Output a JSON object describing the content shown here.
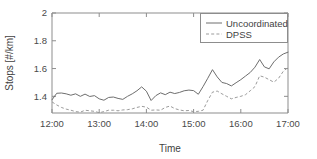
{
  "chart_data": {
    "type": "line",
    "title": "",
    "xlabel": "Time",
    "ylabel": "Stops [#/km]",
    "xlim": [
      12.0,
      17.0
    ],
    "ylim": [
      1.28,
      2.0
    ],
    "grid": false,
    "legend_position": "top-right",
    "xticks": [
      12.0,
      13.0,
      14.0,
      15.0,
      16.0,
      17.0
    ],
    "xticklabels": [
      "12:00",
      "13:00",
      "14:00",
      "15:00",
      "16:00",
      "17:00"
    ],
    "yticks": [
      1.4,
      1.6,
      1.8,
      2.0
    ],
    "yticklabels": [
      "1.4",
      "1.6",
      "1.8",
      "2"
    ],
    "x": [
      12.0,
      12.1,
      12.2,
      12.3,
      12.4,
      12.5,
      12.6,
      12.7,
      12.8,
      12.9,
      13.0,
      13.1,
      13.2,
      13.3,
      13.4,
      13.5,
      13.6,
      13.7,
      13.8,
      13.9,
      14.0,
      14.1,
      14.2,
      14.3,
      14.4,
      14.5,
      14.6,
      14.7,
      14.8,
      14.9,
      15.0,
      15.1,
      15.2,
      15.3,
      15.4,
      15.5,
      15.6,
      15.7,
      15.8,
      15.9,
      16.0,
      16.1,
      16.2,
      16.3,
      16.4,
      16.5,
      16.6,
      16.7,
      16.8,
      16.9,
      17.0
    ],
    "series": [
      {
        "name": "Uncoordinated",
        "style": "solid",
        "color": "#6e6e6e",
        "values": [
          1.375,
          1.422,
          1.424,
          1.418,
          1.408,
          1.418,
          1.4,
          1.416,
          1.399,
          1.405,
          1.382,
          1.372,
          1.392,
          1.395,
          1.385,
          1.378,
          1.4,
          1.418,
          1.44,
          1.468,
          1.437,
          1.37,
          1.405,
          1.425,
          1.412,
          1.43,
          1.42,
          1.428,
          1.44,
          1.445,
          1.441,
          1.415,
          1.47,
          1.53,
          1.592,
          1.54,
          1.5,
          1.492,
          1.475,
          1.498,
          1.52,
          1.546,
          1.572,
          1.61,
          1.665,
          1.612,
          1.598,
          1.648,
          1.682,
          1.705,
          1.718
        ]
      },
      {
        "name": "DPSS",
        "style": "dashed",
        "color": "#9b9b9b",
        "values": [
          1.36,
          1.338,
          1.32,
          1.308,
          1.3,
          1.29,
          1.286,
          1.3,
          1.296,
          1.292,
          1.282,
          1.29,
          1.3,
          1.3,
          1.296,
          1.302,
          1.304,
          1.31,
          1.32,
          1.328,
          1.322,
          1.3,
          1.302,
          1.3,
          1.32,
          1.33,
          1.312,
          1.302,
          1.296,
          1.298,
          1.29,
          1.292,
          1.3,
          1.37,
          1.43,
          1.438,
          1.418,
          1.4,
          1.382,
          1.392,
          1.4,
          1.412,
          1.44,
          1.47,
          1.548,
          1.538,
          1.52,
          1.502,
          1.53,
          1.58,
          1.608
        ]
      }
    ]
  },
  "legend": {
    "entries": [
      {
        "label": "Uncoordinated",
        "style": "solid"
      },
      {
        "label": "DPSS",
        "style": "dashed"
      }
    ]
  },
  "axes": {
    "x_title": "Time",
    "y_title": "Stops [#/km]"
  }
}
